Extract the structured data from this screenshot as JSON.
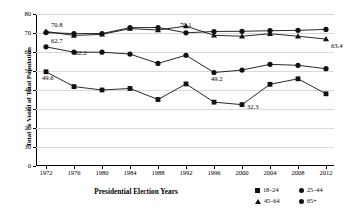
{
  "chart_data": {
    "type": "line",
    "title": "",
    "xlabel": "Presidential Election Years",
    "ylabel": "Total % Voted of Total Population",
    "categories": [
      "1972",
      "1976",
      "1980",
      "1984",
      "1988",
      "1992",
      "1996",
      "2000",
      "2004",
      "2008",
      "2012"
    ],
    "ylim": [
      0,
      80
    ],
    "yticks": [
      "0",
      "10",
      "20",
      "30",
      "40",
      "50",
      "60",
      "70",
      "80"
    ],
    "grid": true,
    "legend_position": "bottom-right",
    "series": [
      {
        "name": "18–24",
        "marker": "square",
        "values": [
          49.6,
          41.8,
          40.0,
          40.8,
          35.0,
          43.2,
          33.6,
          32.3,
          43.0,
          45.9,
          38.0
        ]
      },
      {
        "name": "25–44",
        "marker": "circle",
        "values": [
          62.7,
          59.9,
          59.9,
          58.9,
          54.0,
          58.3,
          49.2,
          50.5,
          53.5,
          53.0,
          51.2
        ]
      },
      {
        "name": "45–64",
        "marker": "triangle",
        "values": [
          70.8,
          68.7,
          69.3,
          72.3,
          71.6,
          73.6,
          68.8,
          68.3,
          69.6,
          68.3,
          66.8
        ]
      },
      {
        "name": "65+",
        "marker": "circle",
        "values": [
          70.2,
          69.7,
          69.7,
          72.8,
          72.9,
          70.1,
          70.8,
          70.9,
          71.2,
          71.4,
          71.9
        ]
      }
    ],
    "annotations": [
      {
        "text": "70.8",
        "series": "45–64",
        "category": "1972",
        "value": 70.8
      },
      {
        "text": "62.7",
        "series": "25–44",
        "category": "1972",
        "value": 62.7
      },
      {
        "text": "62.2",
        "series": "45–64",
        "category": "1976",
        "value": 62.2
      },
      {
        "text": "49.6",
        "series": "18–24",
        "category": "1972",
        "value": 49.6
      },
      {
        "text": "70.1",
        "series": "65+",
        "category": "1992",
        "value": 70.1
      },
      {
        "text": "49.2",
        "series": "25–44",
        "category": "1996",
        "value": 49.2
      },
      {
        "text": "32.3",
        "series": "18–24",
        "category": "2000",
        "value": 32.3
      },
      {
        "text": "63.4",
        "series": "45–64",
        "category": "2012",
        "value": 63.4
      }
    ]
  },
  "axes": {
    "y_title": "Total % Voted of Total Population",
    "x_title": "Presidential Election Years"
  },
  "legend": {
    "items": [
      {
        "label": "18–24",
        "marker": "square"
      },
      {
        "label": "25–44",
        "marker": "circle"
      },
      {
        "label": "45–64",
        "marker": "triangle"
      },
      {
        "label": "65+",
        "marker": "circle"
      }
    ]
  },
  "colors": {
    "series": "#111111",
    "grid": "#d9d9d9",
    "axis": "#000000"
  }
}
